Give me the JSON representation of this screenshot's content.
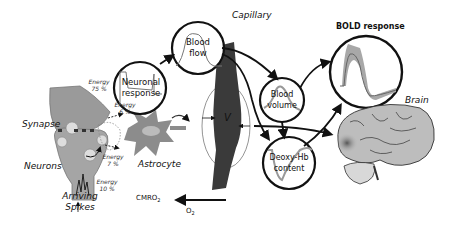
{
  "diagram": {
    "title_labels": {
      "capillary": "Capillary",
      "bold_response": "BOLD response",
      "brain": "Brain",
      "synapse": "Synapse",
      "neurons": "Neurons",
      "astrocyte": "Astrocyte",
      "arriving_spikes_line1": "Arriving",
      "arriving_spikes_line2": "Spikes",
      "volume_symbol": "V",
      "cmro2": "CMRO",
      "cmro2_sub": "2",
      "o2": "O",
      "o2_sub": "2"
    },
    "circles": {
      "neuronal_response": {
        "line1": "Neuronal",
        "line2": "response"
      },
      "blood_flow": {
        "line1": "Blood",
        "line2": "flow"
      },
      "blood_volume": {
        "line1": "Blood",
        "line2": "volume"
      },
      "deoxy_hb": {
        "line1": "Deoxy-Hb",
        "line2": "content"
      }
    },
    "energy": [
      {
        "label": "Energy",
        "value": "75 %"
      },
      {
        "label": "Energy",
        "value": "6 %"
      },
      {
        "label": "Energy",
        "value": "7 %"
      },
      {
        "label": "Energy",
        "value": "10 %"
      }
    ],
    "colors": {
      "outline": "#111111",
      "neuron_fill": "#9a9a9a",
      "astrocyte_fill": "#8c8c8c",
      "capillary_fill": "#3a3a3a",
      "brain_fill": "#bdbdbd",
      "bold_band": "#a8a8a8"
    }
  }
}
